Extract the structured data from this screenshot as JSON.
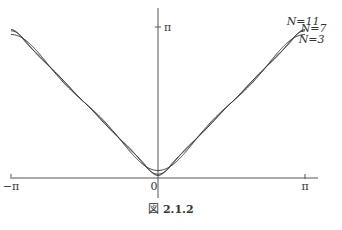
{
  "chart_data": {
    "type": "line",
    "title": "",
    "caption_prefix": "図",
    "caption_number": "2.1.2",
    "xlabel": "",
    "ylabel": "",
    "xlim": [
      -3.14159,
      3.14159
    ],
    "ylim": [
      0,
      3.14159
    ],
    "x_ticks": [
      {
        "value": -3.14159,
        "label": "−π"
      },
      {
        "value": 0,
        "label": "0"
      },
      {
        "value": 3.14159,
        "label": "π"
      }
    ],
    "y_ticks": [
      {
        "value": 3.14159,
        "label": "π"
      }
    ],
    "function": "Fourier partial sums of |x|",
    "series": [
      {
        "name": "N=3",
        "N": 3
      },
      {
        "name": "N=7",
        "N": 7
      },
      {
        "name": "N=11",
        "N": 11
      }
    ],
    "grid": false,
    "legend": "inline labels at top-right of curves"
  }
}
